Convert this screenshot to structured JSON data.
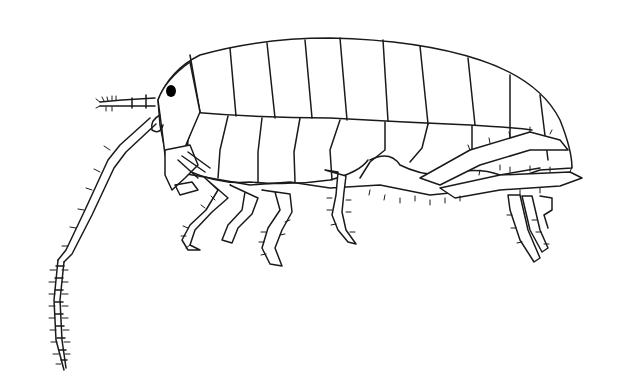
{
  "image": {
    "subject": "amphipod line drawing",
    "background_color": "#ffffff",
    "line_color": "#1a1a1a",
    "eye_color": "#000000",
    "width": 620,
    "height": 390
  }
}
